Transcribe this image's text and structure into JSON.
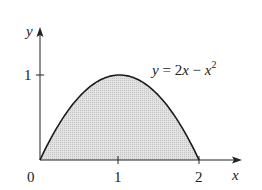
{
  "chart_data": {
    "type": "area",
    "title": "",
    "function_label": "y = 2x − x²",
    "function_label_parts": {
      "lhs": "y",
      "eq": " = 2",
      "x1": "x",
      "minus": " − ",
      "x2": "x",
      "exp": "2"
    },
    "xlabel": "x",
    "ylabel": "y",
    "x_ticks": [
      {
        "value": 0,
        "label": "0"
      },
      {
        "value": 1,
        "label": "1"
      },
      {
        "value": 2,
        "label": "2"
      }
    ],
    "y_ticks": [
      {
        "value": 1,
        "label": "1"
      }
    ],
    "xlim": [
      0,
      2.5
    ],
    "ylim": [
      0,
      1.5
    ],
    "grid": false,
    "x": [
      0,
      0.25,
      0.5,
      0.75,
      1,
      1.25,
      1.5,
      1.75,
      2
    ],
    "values": [
      0,
      0.4375,
      0.75,
      0.9375,
      1,
      0.9375,
      0.75,
      0.4375,
      0
    ],
    "shaded_region": {
      "from": 0,
      "to": 2,
      "between": "curve and x-axis"
    },
    "colors": {
      "curve": "#1a1a1a",
      "fill": "#d4d4d4",
      "axes": "#222222"
    }
  }
}
